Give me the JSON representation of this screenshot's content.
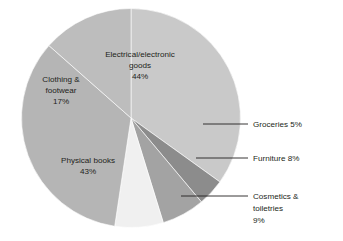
{
  "chart_data": {
    "type": "pie",
    "title": "",
    "subtitle": "",
    "xlabel": "",
    "ylabel": "",
    "legend_position": "none",
    "grid": false,
    "units": "percent",
    "note": "Values are labelled percentages and sum to 126% (multiple-response style data)",
    "categories": [
      "Electrical/electronic goods",
      "Groceries",
      "Furniture",
      "Cosmetics & toiletries",
      "Physical books",
      "Clothing & footwear"
    ],
    "values": [
      44,
      5,
      8,
      9,
      43,
      17
    ],
    "colors": [
      "#c9c9c9",
      "#8c8c8c",
      "#a3a3a3",
      "#f0f0f0",
      "#b5b5b5",
      "#bdbdbd"
    ],
    "label_mode": [
      "inside",
      "callout",
      "callout",
      "callout",
      "inside",
      "inside"
    ],
    "slices": [
      {
        "name": "Electrical/electronic goods",
        "value": 44,
        "value_text": "44%",
        "color": "#c9c9c9",
        "label_lines": [
          "Electrical/electronic",
          "goods",
          "44%"
        ],
        "label_mode": "inside"
      },
      {
        "name": "Groceries",
        "value": 5,
        "value_text": "5%",
        "color": "#8c8c8c",
        "label_lines": [
          "Groceries 5%"
        ],
        "label_mode": "callout"
      },
      {
        "name": "Furniture",
        "value": 8,
        "value_text": "8%",
        "color": "#a3a3a3",
        "label_lines": [
          "Furniture 8%"
        ],
        "label_mode": "callout"
      },
      {
        "name": "Cosmetics & toiletries",
        "value": 9,
        "value_text": "9%",
        "color": "#f0f0f0",
        "label_lines": [
          "Cosmetics &",
          "toiletries",
          "9%"
        ],
        "label_mode": "callout"
      },
      {
        "name": "Physical books",
        "value": 43,
        "value_text": "43%",
        "color": "#b5b5b5",
        "label_lines": [
          "Physical books",
          "43%"
        ],
        "label_mode": "inside"
      },
      {
        "name": "Clothing & footwear",
        "value": 17,
        "value_text": "17%",
        "color": "#bdbdbd",
        "label_lines": [
          "Clothing &",
          "footwear",
          "17%"
        ],
        "label_mode": "inside"
      }
    ]
  },
  "labels": {
    "electrical_line1": "Electrical/electronic",
    "electrical_line2": "goods",
    "electrical_line3": "44%",
    "clothing_line1": "Clothing &",
    "clothing_line2": "footwear",
    "clothing_line3": "17%",
    "books_line1": "Physical books",
    "books_line2": "43%",
    "groceries_text": "Groceries 5%",
    "furniture_text": "Furniture 8%",
    "cosmetics_line1": "Cosmetics &",
    "cosmetics_line2": "toiletries",
    "cosmetics_line3": "9%"
  }
}
